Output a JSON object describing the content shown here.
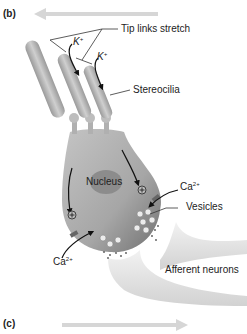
{
  "panels": {
    "b": "(b)",
    "c": "(c)"
  },
  "labels": {
    "tip_links": "Tip links stretch",
    "k_ion_1": "K",
    "k_ion_1_sup": "+",
    "k_ion_2": "K",
    "k_ion_2_sup": "+",
    "stereocilia": "Stereocilia",
    "nucleus": "Nucleus",
    "ca_ion_right": "Ca",
    "ca_ion_right_sup": "2+",
    "vesicles": "Vesicles",
    "ca_ion_left": "Ca",
    "ca_ion_left_sup": "2+",
    "afferent_neurons": "Afferent neurons"
  },
  "arrows": {
    "b_direction": "left",
    "c_direction": "right"
  },
  "colors": {
    "direction_arrow": "#d6d6d6",
    "cell_body": "#a8a8a8",
    "stereocilia": "#b4b4b4",
    "nucleus": "#8c8c8c",
    "neuron": "#e6e6e6",
    "text": "#222222"
  }
}
